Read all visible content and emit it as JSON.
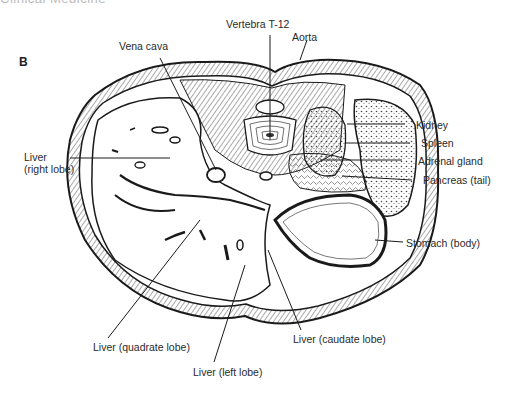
{
  "header": {
    "cut_title": "Clinical Medicine"
  },
  "panel_label": "B",
  "diagram": {
    "labels": {
      "vertebra": "Vertebra T-12",
      "aorta": "Aorta",
      "vena_cava": "Vena cava",
      "liver_right_l1": "Liver",
      "liver_right_l2": "(right lobe)",
      "kidney": "Kidney",
      "spleen": "Spleen",
      "adrenal": "Adrenal gland",
      "pancreas": "Pancreas (tail)",
      "stomach": "Stomach (body)",
      "liver_quadrate": "Liver (quadrate lobe)",
      "liver_caudate": "Liver (caudate lobe)",
      "liver_left": "Liver (left lobe)"
    },
    "colors": {
      "ink": "#1a1a1a",
      "label": "#2a2a2a",
      "hatch": "#555555",
      "background": "#ffffff"
    }
  }
}
